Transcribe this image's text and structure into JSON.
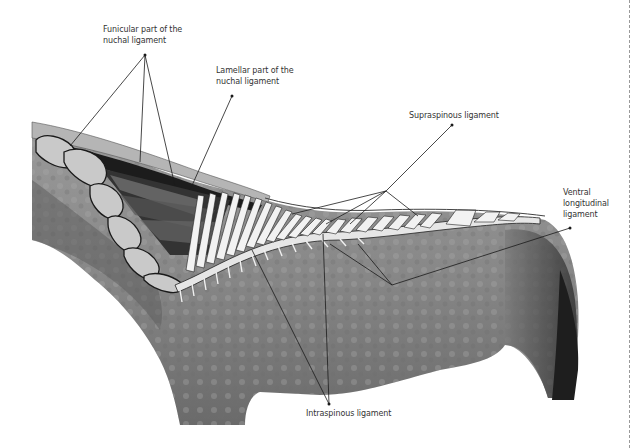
{
  "figure": {
    "labels": [
      {
        "id": "funicular",
        "text": "Funicular part of the\nnuchal ligament",
        "x": 103,
        "y": 24
      },
      {
        "id": "lamellar",
        "text": "Lamellar part of the\nnuchal ligament",
        "x": 216,
        "y": 65
      },
      {
        "id": "supraspinous",
        "text": "Supraspinous ligament",
        "x": 409,
        "y": 110
      },
      {
        "id": "ventral",
        "text": "Ventral\nlongitudinal\nligament",
        "x": 563,
        "y": 187
      },
      {
        "id": "intraspinous",
        "text": "Intraspinous ligament",
        "x": 306,
        "y": 408
      }
    ],
    "colors": {
      "background": "#ffffff",
      "label_text": "#333333",
      "leader_line": "#1a1a1a",
      "coat": "#8a8a8a",
      "bone": "#ececec",
      "dashed_edge": "#9a9a9a"
    }
  }
}
